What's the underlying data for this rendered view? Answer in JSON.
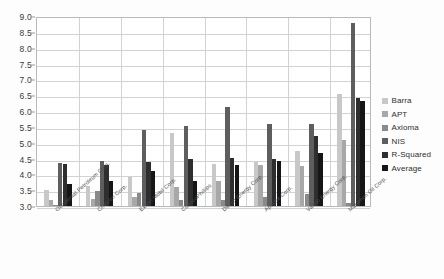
{
  "chart_data": {
    "type": "bar",
    "title": "",
    "xlabel": "",
    "ylabel": "",
    "ylim": [
      3.0,
      9.0
    ],
    "ytick_step": 0.5,
    "grid": true,
    "legend_position": "right",
    "yticks": [
      "9.0",
      "8.5",
      "8.0",
      "7.5",
      "7.0",
      "6.5",
      "6.0",
      "5.5",
      "5.0",
      "4.5",
      "4.0",
      "3.5",
      "3.0"
    ],
    "categories": [
      "Occidental Petroleum Corp.",
      "Chevron Corp.",
      "Exxon Mobil Corp.",
      "ConocoPhillips",
      "Devon Energy Corp.",
      "Apache Corp.",
      "Valero Energy Corp.",
      "Marathon Oil Corp."
    ],
    "series": [
      {
        "name": "Barra",
        "color": "#c8c8c8",
        "values": [
          3.52,
          3.62,
          3.92,
          5.3,
          4.32,
          4.4,
          4.75,
          6.55
        ]
      },
      {
        "name": "APT",
        "color": "#a8a8a8",
        "values": [
          3.18,
          3.22,
          3.3,
          3.6,
          3.8,
          4.28,
          4.25,
          5.1
        ]
      },
      {
        "name": "Axioma",
        "color": "#8a8a8a",
        "values": [
          3.02,
          3.48,
          3.4,
          3.18,
          3.18,
          3.28,
          3.38,
          3.08
        ]
      },
      {
        "name": "NIS",
        "color": "#5e5e5e",
        "values": [
          4.36,
          4.42,
          5.4,
          5.52,
          6.12,
          5.58,
          5.6,
          8.78
        ]
      },
      {
        "name": "R-Squared",
        "color": "#2e2e2e",
        "values": [
          4.34,
          4.3,
          4.4,
          4.48,
          4.52,
          4.5,
          5.2,
          6.4
        ]
      },
      {
        "name": "Average",
        "color": "#161616",
        "values": [
          3.7,
          3.78,
          4.1,
          3.8,
          4.3,
          4.42,
          4.68,
          6.32
        ]
      }
    ]
  }
}
